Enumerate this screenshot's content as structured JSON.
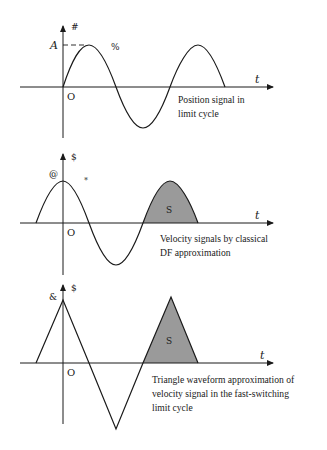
{
  "panels": [
    {
      "id": "position",
      "y_axis_label": "#",
      "amplitude_label": "A",
      "marker_label": "%",
      "x_axis_label": "t",
      "origin_label": "O",
      "caption_lines": [
        "Position signal in",
        "limit cycle"
      ],
      "waveform": "sine",
      "shaded_label": ""
    },
    {
      "id": "velocity-df",
      "y_axis_label": "$",
      "amplitude_label": "@",
      "marker_label": "*",
      "x_axis_label": "t",
      "origin_label": "O",
      "caption_lines": [
        "Velocity signals by classical",
        "DF approximation"
      ],
      "waveform": "cosine",
      "shaded_label": "S"
    },
    {
      "id": "velocity-triangle",
      "y_axis_label": "$",
      "amplitude_label": "&",
      "marker_label": "",
      "x_axis_label": "t",
      "origin_label": "O",
      "caption_lines": [
        "Triangle waveform approximation of",
        "velocity signal in the fast-switching",
        "limit cycle"
      ],
      "waveform": "triangle",
      "shaded_label": "S"
    }
  ],
  "colors": {
    "line": "#1a1a1a",
    "shade": "#9a9a9a",
    "background": "#ffffff"
  }
}
